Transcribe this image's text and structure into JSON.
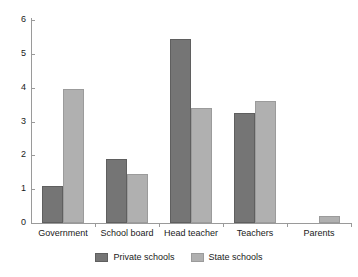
{
  "chart_data": {
    "type": "bar",
    "title": "",
    "xlabel": "",
    "ylabel": "",
    "ylim": [
      0,
      6
    ],
    "ytick_labels": [
      "0",
      "1",
      "2",
      "3",
      "4",
      "5",
      "6"
    ],
    "ytick_values": [
      0,
      1,
      2,
      3,
      4,
      5,
      6
    ],
    "grid": false,
    "legend_position": "bottom-center",
    "categories": [
      "Government",
      "School board",
      "Head teacher",
      "Teachers",
      "Parents"
    ],
    "series": [
      {
        "name": "Private schools",
        "color": "#757575",
        "values": [
          1.1,
          1.9,
          5.45,
          3.25,
          0
        ]
      },
      {
        "name": "State schools",
        "color": "#b0b0b0",
        "values": [
          3.95,
          1.45,
          3.4,
          3.6,
          0.2
        ]
      }
    ]
  },
  "colors": {
    "private": "#757575",
    "state": "#b0b0b0",
    "axis": "#9a9a9a",
    "text": "#1a1a1a",
    "background": "#ffffff"
  }
}
